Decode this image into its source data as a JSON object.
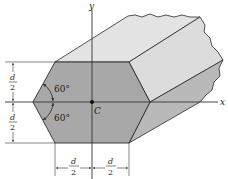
{
  "figure": {
    "axes": {
      "x_label": "x",
      "y_label": "y"
    },
    "centroid_label": "C",
    "angles": {
      "upper": "60°",
      "lower": "60°"
    },
    "dimensions": {
      "left_upper": {
        "num": "d",
        "den": "2"
      },
      "left_lower": {
        "num": "d",
        "den": "2"
      },
      "bottom_left": {
        "num": "d",
        "den": "2"
      },
      "bottom_right": {
        "num": "d",
        "den": "2"
      }
    },
    "colors": {
      "front_face": "#a8a8a8",
      "top_face": "#e3e3e3",
      "upper_right_face": "#dcdcdc",
      "lower_right_face": "#b9b9b9",
      "line": "#2a2a2a",
      "axis": "#333333"
    }
  }
}
